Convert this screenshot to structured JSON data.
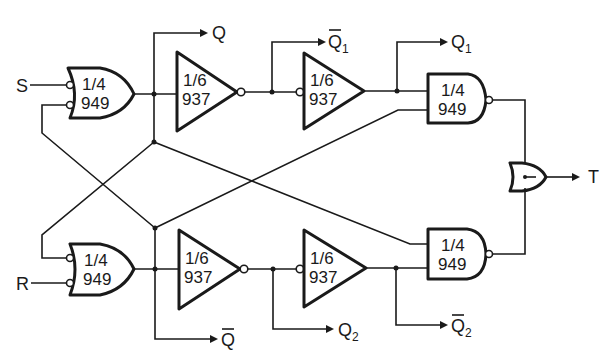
{
  "diagram": {
    "title": "",
    "inputs": {
      "s": "S",
      "r": "R"
    },
    "outputs": {
      "q": "Q",
      "q_bar": "Q",
      "q1": "Q",
      "q1_sub": "1",
      "q1_bar": "Q",
      "q1_bar_sub": "1",
      "q2": "Q",
      "q2_sub": "2",
      "q2_bar": "Q",
      "q2_bar_sub": "2",
      "t": "T"
    },
    "gates": {
      "or_top": {
        "fraction": "1/4",
        "part": "949"
      },
      "or_bottom": {
        "fraction": "1/4",
        "part": "949"
      },
      "inv_top_1": {
        "fraction": "1/6",
        "part": "937"
      },
      "inv_top_2": {
        "fraction": "1/6",
        "part": "937"
      },
      "inv_bottom_1": {
        "fraction": "1/6",
        "part": "937"
      },
      "inv_bottom_2": {
        "fraction": "1/6",
        "part": "937"
      },
      "nand_top": {
        "fraction": "1/4",
        "part": "949"
      },
      "nand_bottom": {
        "fraction": "1/4",
        "part": "949"
      },
      "or_final": {
        "fraction": "",
        "part": ""
      }
    },
    "colors": {
      "ink": "#1a1a1a",
      "paper": "#ffffff"
    }
  }
}
